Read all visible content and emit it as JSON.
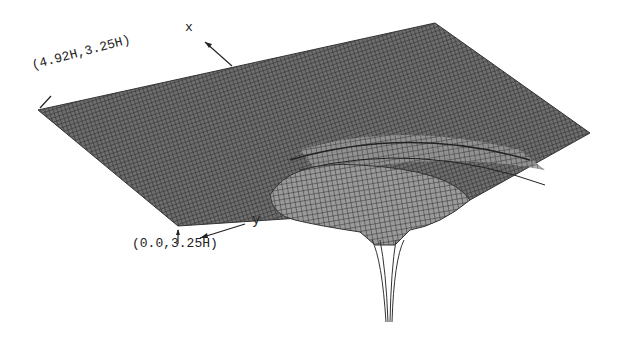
{
  "figure": {
    "type": "3d-wireframe-surface",
    "colors": {
      "mesh": "#333333",
      "background": "#ffffff"
    },
    "labels": {
      "corner_top": "(4.92H,3.25H)",
      "corner_bottom": "(0.0,3.25H)",
      "axis_x": "x",
      "axis_y": "y"
    }
  }
}
